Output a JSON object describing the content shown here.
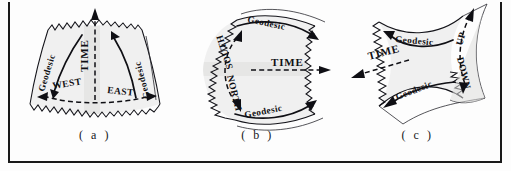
{
  "figure": {
    "background_color": "#fdfdfd",
    "ink_color": "#14141a",
    "shading_color": "#e9e9e9",
    "frame": {
      "left_rule": true,
      "right_rule": true,
      "bottom_rule": true,
      "top_rule": false
    }
  },
  "panels": [
    {
      "id": "a",
      "caption": "( a )",
      "labels": {
        "time": "TIME",
        "geodesic_left": "Geodesic",
        "geodesic_right": "Geodesic",
        "direction_left": "WEST",
        "direction_right": "EAST"
      },
      "arrows": {
        "time_direction": "up",
        "time_style": "dashed",
        "horizontal_style": "dashed",
        "geodesic_left_direction": "down",
        "geodesic_right_direction": "up",
        "west_direction": "left",
        "east_direction": "right"
      }
    },
    {
      "id": "b",
      "caption": "( b )",
      "labels": {
        "time": "TIME",
        "geodesic_top": "Geodesic",
        "geodesic_bottom": "Geodesic",
        "direction_top": "SOUTH",
        "direction_bottom": "NORTH"
      },
      "arrows": {
        "time_direction": "right",
        "time_style": "dashed",
        "meridian_style": "dashed",
        "geodesic_top_direction": "right",
        "geodesic_bottom_direction": "right",
        "south_direction": "up",
        "north_direction": "down"
      }
    },
    {
      "id": "c",
      "caption": "( c )",
      "labels": {
        "time": "TIME",
        "geodesic_top": "Geodesic",
        "geodesic_bottom": "Geodesic",
        "direction_up": "UP",
        "direction_down": "DOWN"
      },
      "arrows": {
        "time_direction": "left",
        "time_style": "dashed",
        "vertical_style": "dashed",
        "geodesic_top_direction": "left",
        "geodesic_bottom_direction": "left",
        "up_direction": "up",
        "down_direction": "down"
      }
    }
  ]
}
